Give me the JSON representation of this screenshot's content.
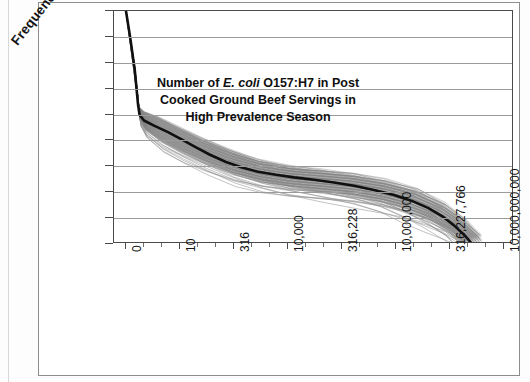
{
  "figure": {
    "kind": "scanned-figure",
    "background": "#ffffff",
    "frame_color": "#8d8d8d"
  },
  "axis_title_parts": {
    "line1_pre": "Number of ",
    "line1_italic": "E. coli",
    "line1_post": " O157:H7 in Post",
    "line2": "Cooked Ground Beef Servings in",
    "line3": "High Prevalence Season"
  },
  "chart_data": {
    "type": "line",
    "title": "",
    "subtitle": "",
    "xlabel": "Number of E. coli O157:H7 in Post Cooked Ground Beef Servings in High Prevalence Season",
    "ylabel": "Frequency",
    "xscale": "log",
    "yscale": "log",
    "grid": true,
    "legend": false,
    "legend_position": "none",
    "ylim": [
      1e-09,
      1
    ],
    "ytick_labels": [
      "1",
      "0.1",
      "0.01",
      "0.001",
      "0.0001",
      "0.00001",
      "0.000001",
      "0.0000001",
      "0.00000001",
      "0.000000001"
    ],
    "ytick_values": [
      1,
      0.1,
      0.01,
      0.001,
      0.0001,
      1e-05,
      1e-06,
      1e-07,
      1e-08,
      1e-09
    ],
    "xtick_labels": [
      "0",
      "10",
      "316",
      "10,000",
      "316,228",
      "10,000,000",
      "316,227,766",
      "10,000,000,000"
    ],
    "xtick_values": [
      0,
      10,
      316,
      10000,
      316228,
      10000000,
      316227766,
      10000000000
    ],
    "xtick_positions_frac": [
      0.03,
      0.165,
      0.3,
      0.435,
      0.57,
      0.705,
      0.84,
      0.975
    ],
    "minor_ticks_between": 2,
    "series": [
      {
        "name": "mean-exceedance-curve",
        "role": "central bold line",
        "color": "#101010",
        "width": 2.6,
        "points_frac": [
          [
            0.03,
            0.0
          ],
          [
            0.041,
            0.12
          ],
          [
            0.052,
            0.255
          ],
          [
            0.06,
            0.4
          ],
          [
            0.064,
            0.447
          ],
          [
            0.075,
            0.47
          ],
          [
            0.1,
            0.492
          ],
          [
            0.135,
            0.52
          ],
          [
            0.17,
            0.552
          ],
          [
            0.205,
            0.585
          ],
          [
            0.24,
            0.617
          ],
          [
            0.28,
            0.648
          ],
          [
            0.32,
            0.672
          ],
          [
            0.36,
            0.69
          ],
          [
            0.405,
            0.703
          ],
          [
            0.45,
            0.714
          ],
          [
            0.5,
            0.724
          ],
          [
            0.55,
            0.736
          ],
          [
            0.6,
            0.75
          ],
          [
            0.65,
            0.768
          ],
          [
            0.7,
            0.79
          ],
          [
            0.745,
            0.815
          ],
          [
            0.785,
            0.845
          ],
          [
            0.82,
            0.88
          ],
          [
            0.85,
            0.92
          ],
          [
            0.875,
            0.96
          ],
          [
            0.893,
            0.995
          ]
        ]
      },
      {
        "name": "uncertainty-band",
        "role": "bundle of ~100 gray simulation curves",
        "color": "#808080",
        "width": 0.7,
        "count": 100,
        "upper_frac": [
          [
            0.03,
            0.0
          ],
          [
            0.052,
            0.24
          ],
          [
            0.062,
            0.41
          ],
          [
            0.075,
            0.432
          ],
          [
            0.11,
            0.455
          ],
          [
            0.16,
            0.498
          ],
          [
            0.22,
            0.548
          ],
          [
            0.29,
            0.598
          ],
          [
            0.36,
            0.64
          ],
          [
            0.44,
            0.668
          ],
          [
            0.52,
            0.684
          ],
          [
            0.6,
            0.702
          ],
          [
            0.68,
            0.73
          ],
          [
            0.76,
            0.772
          ],
          [
            0.83,
            0.835
          ],
          [
            0.88,
            0.905
          ],
          [
            0.92,
            0.975
          ]
        ],
        "lower_frac": [
          [
            0.03,
            0.0
          ],
          [
            0.052,
            0.275
          ],
          [
            0.066,
            0.47
          ],
          [
            0.08,
            0.51
          ],
          [
            0.12,
            0.56
          ],
          [
            0.17,
            0.605
          ],
          [
            0.23,
            0.652
          ],
          [
            0.3,
            0.7
          ],
          [
            0.37,
            0.735
          ],
          [
            0.44,
            0.758
          ],
          [
            0.52,
            0.776
          ],
          [
            0.6,
            0.796
          ],
          [
            0.67,
            0.822
          ],
          [
            0.73,
            0.856
          ],
          [
            0.79,
            0.9
          ],
          [
            0.84,
            0.95
          ],
          [
            0.872,
            0.998
          ]
        ]
      }
    ],
    "annotations": [
      "Steep near-vertical drop from frequency 1 to about 1e-4 at the smallest dose bin",
      "Long shallow decline across the mid-range doses",
      "Sharp fan-out and terminal plunge to 1e-9 beyond ~3x10^8 organisms"
    ]
  }
}
